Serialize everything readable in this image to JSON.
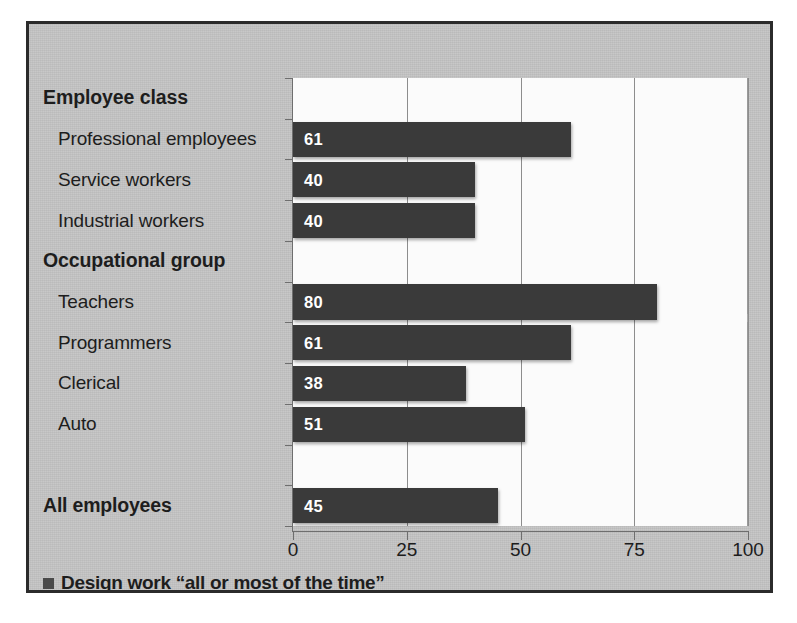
{
  "chart_data": {
    "type": "bar",
    "orientation": "horizontal",
    "title": "",
    "xlabel": "",
    "ylabel": "",
    "xlim": [
      0,
      100
    ],
    "xticks": [
      "0",
      "25",
      "50",
      "75",
      "100"
    ],
    "grid": true,
    "legend_position": "bottom-left",
    "legend": [
      "Design work  “all or most of the time”"
    ],
    "series_color": "#3a3a3a",
    "rows": [
      {
        "label": "Employee class",
        "kind": "group-head",
        "value": null
      },
      {
        "label": "Professional employees",
        "kind": "item",
        "value": 61
      },
      {
        "label": "Service workers",
        "kind": "item",
        "value": 40
      },
      {
        "label": "Industrial workers",
        "kind": "item",
        "value": 40
      },
      {
        "label": "Occupational group",
        "kind": "group-head",
        "value": null
      },
      {
        "label": "Teachers",
        "kind": "item",
        "value": 80
      },
      {
        "label": "Programmers",
        "kind": "item",
        "value": 61
      },
      {
        "label": "Clerical",
        "kind": "item",
        "value": 38
      },
      {
        "label": "Auto",
        "kind": "item",
        "value": 51
      },
      {
        "label": "",
        "kind": "spacer",
        "value": null
      },
      {
        "label": "All employees",
        "kind": "total",
        "value": 45
      }
    ],
    "categories": [
      "Professional employees",
      "Service workers",
      "Industrial workers",
      "Teachers",
      "Programmers",
      "Clerical",
      "Auto",
      "All employees"
    ],
    "values": [
      61,
      40,
      40,
      80,
      61,
      38,
      51,
      45
    ]
  },
  "legend": {
    "label": "Design work  “all or most of the time”"
  },
  "colors": {
    "bar": "#3a3a3a",
    "frame": "#2b2b2b",
    "paper": "#c5c5c5",
    "plot": "#fbfbfb",
    "axis": "#6e6e6e"
  }
}
